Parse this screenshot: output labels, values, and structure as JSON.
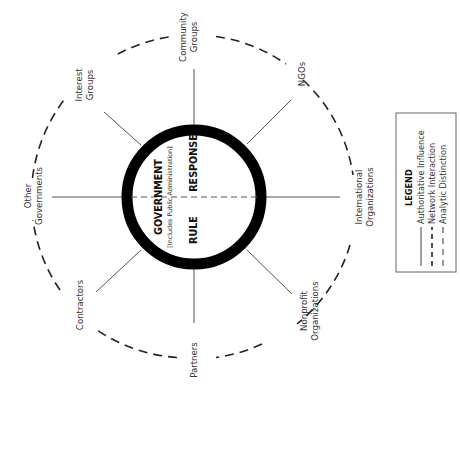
{
  "diagram": {
    "center": {
      "title": "GOVERNMENT",
      "subtitle": "[Includes Public Administration]",
      "left_half": "RULE",
      "right_half": "RESPONSE"
    },
    "actors": [
      {
        "id": "community-groups",
        "lines": [
          "Community",
          "Groups"
        ]
      },
      {
        "id": "ngos",
        "lines": [
          "NGOs"
        ]
      },
      {
        "id": "international-organizations",
        "lines": [
          "International",
          "Organizations"
        ]
      },
      {
        "id": "nonprofit-organizations",
        "lines": [
          "Nonprofit",
          "Organizations"
        ]
      },
      {
        "id": "partners",
        "lines": [
          "Partners"
        ]
      },
      {
        "id": "contractors",
        "lines": [
          "Contractors"
        ]
      },
      {
        "id": "other-governments",
        "lines": [
          "Other",
          "Governments"
        ]
      },
      {
        "id": "interest-groups",
        "lines": [
          "Interest",
          "Groups"
        ]
      }
    ],
    "colors": {
      "ring": "#000000",
      "spoke": "#555555",
      "outer_dash": "#222222",
      "legend_border": "#666666"
    }
  },
  "legend": {
    "title": "LEGEND",
    "items": [
      {
        "style": "solid",
        "label": "Authoritative Influence"
      },
      {
        "style": "long-dash",
        "label": "Network Interaction"
      },
      {
        "style": "short-dash",
        "label": "Analytic Distinction"
      }
    ]
  }
}
